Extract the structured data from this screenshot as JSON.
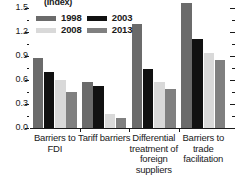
{
  "chart_data": {
    "type": "bar",
    "title": "(Index)",
    "xlabel": "",
    "ylabel": "",
    "ylim": [
      0.0,
      1.5
    ],
    "ytick_labels": [
      "0.0",
      "0.3",
      "0.6",
      "0.9",
      "1.2",
      "1.5"
    ],
    "ytick_values": [
      0.0,
      0.3,
      0.6,
      0.9,
      1.2,
      1.5
    ],
    "minor_ticks": true,
    "grid": false,
    "legend_position": "top-left",
    "categories": [
      "Barriers to FDI",
      "Tariff barriers",
      "Differential treatment of foreign suppliers",
      "Barriers to trade facilitation"
    ],
    "category_lines": [
      [
        "Barriers to",
        "FDI"
      ],
      [
        "Tariff barriers"
      ],
      [
        "Differential",
        "treatment of",
        "foreign",
        "suppliers"
      ],
      [
        "Barriers to",
        "trade",
        "facilitation"
      ]
    ],
    "series": [
      {
        "name": "1998",
        "color": "#6b6b6b",
        "values": [
          0.87,
          0.58,
          1.3,
          1.56
        ]
      },
      {
        "name": "2003",
        "color": "#111111",
        "values": [
          0.7,
          0.52,
          0.74,
          1.11
        ]
      },
      {
        "name": "2008",
        "color": "#d9d9d9",
        "values": [
          0.6,
          0.17,
          0.58,
          0.94
        ]
      },
      {
        "name": "2013",
        "color": "#808080",
        "values": [
          0.45,
          0.13,
          0.49,
          0.85
        ]
      }
    ]
  }
}
